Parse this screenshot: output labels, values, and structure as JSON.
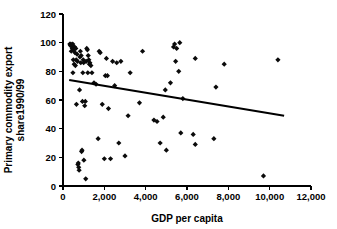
{
  "chart_data": {
    "type": "scatter",
    "title": "",
    "xlabel": "GDP per capita",
    "ylabel": "Primary commodity export share1990/99",
    "ylabel_lines": [
      "Primary commodity export",
      "share1990/99"
    ],
    "xlim": [
      0,
      12000
    ],
    "ylim": [
      0,
      120
    ],
    "xticks": [
      0,
      2000,
      4000,
      6000,
      8000,
      10000,
      12000
    ],
    "xticklabels": [
      "0",
      "2,000",
      "4,000",
      "6,000",
      "8,000",
      "10,000",
      "12,000"
    ],
    "yticks": [
      0,
      20,
      40,
      60,
      80,
      100,
      120
    ],
    "yticklabels": [
      "0",
      "20",
      "40",
      "60",
      "80",
      "100",
      "120"
    ],
    "grid": false,
    "legend": null,
    "marker": "diamond",
    "marker_color": "#0b0b0b",
    "series": [
      {
        "name": "Countries",
        "points": [
          [
            330,
            99
          ],
          [
            360,
            98
          ],
          [
            380,
            99
          ],
          [
            400,
            94
          ],
          [
            420,
            98
          ],
          [
            450,
            96
          ],
          [
            470,
            99
          ],
          [
            480,
            79
          ],
          [
            500,
            88
          ],
          [
            520,
            95
          ],
          [
            540,
            85
          ],
          [
            560,
            97
          ],
          [
            580,
            93
          ],
          [
            600,
            84
          ],
          [
            620,
            96
          ],
          [
            640,
            88
          ],
          [
            650,
            57
          ],
          [
            680,
            92
          ],
          [
            700,
            87
          ],
          [
            720,
            15
          ],
          [
            740,
            16
          ],
          [
            760,
            13
          ],
          [
            780,
            11
          ],
          [
            800,
            67
          ],
          [
            820,
            90
          ],
          [
            840,
            94
          ],
          [
            860,
            86
          ],
          [
            880,
            91
          ],
          [
            900,
            24
          ],
          [
            920,
            25
          ],
          [
            940,
            59
          ],
          [
            960,
            79
          ],
          [
            980,
            88
          ],
          [
            1000,
            86
          ],
          [
            1010,
            18
          ],
          [
            1050,
            56
          ],
          [
            1080,
            59
          ],
          [
            1100,
            5
          ],
          [
            1120,
            87
          ],
          [
            1150,
            96
          ],
          [
            1180,
            95
          ],
          [
            1200,
            79
          ],
          [
            1220,
            91
          ],
          [
            1250,
            88
          ],
          [
            1280,
            85
          ],
          [
            1300,
            86
          ],
          [
            1350,
            84
          ],
          [
            1400,
            79
          ],
          [
            1500,
            72
          ],
          [
            1600,
            71
          ],
          [
            1700,
            33
          ],
          [
            1750,
            94
          ],
          [
            1800,
            93
          ],
          [
            1900,
            57
          ],
          [
            2000,
            19
          ],
          [
            2050,
            77
          ],
          [
            2100,
            89
          ],
          [
            2150,
            77
          ],
          [
            2200,
            54
          ],
          [
            2300,
            19
          ],
          [
            2400,
            87
          ],
          [
            2500,
            70
          ],
          [
            2600,
            86
          ],
          [
            2700,
            30
          ],
          [
            2800,
            87
          ],
          [
            3000,
            21
          ],
          [
            3150,
            49
          ],
          [
            3250,
            79
          ],
          [
            3700,
            58
          ],
          [
            3850,
            94
          ],
          [
            4400,
            46
          ],
          [
            4550,
            45
          ],
          [
            4700,
            30
          ],
          [
            4850,
            48
          ],
          [
            4950,
            67
          ],
          [
            5000,
            25
          ],
          [
            5200,
            72
          ],
          [
            5350,
            97
          ],
          [
            5400,
            99
          ],
          [
            5450,
            87
          ],
          [
            5500,
            96
          ],
          [
            5600,
            80
          ],
          [
            5650,
            100
          ],
          [
            5700,
            37
          ],
          [
            5800,
            61
          ],
          [
            6300,
            36
          ],
          [
            6400,
            29
          ],
          [
            6400,
            89
          ],
          [
            7300,
            33
          ],
          [
            7400,
            69
          ],
          [
            7800,
            85
          ],
          [
            9700,
            7
          ],
          [
            10400,
            88
          ]
        ]
      }
    ],
    "trendline": {
      "x_start": 300,
      "y_start": 74,
      "x_end": 10700,
      "y_end": 49
    }
  }
}
